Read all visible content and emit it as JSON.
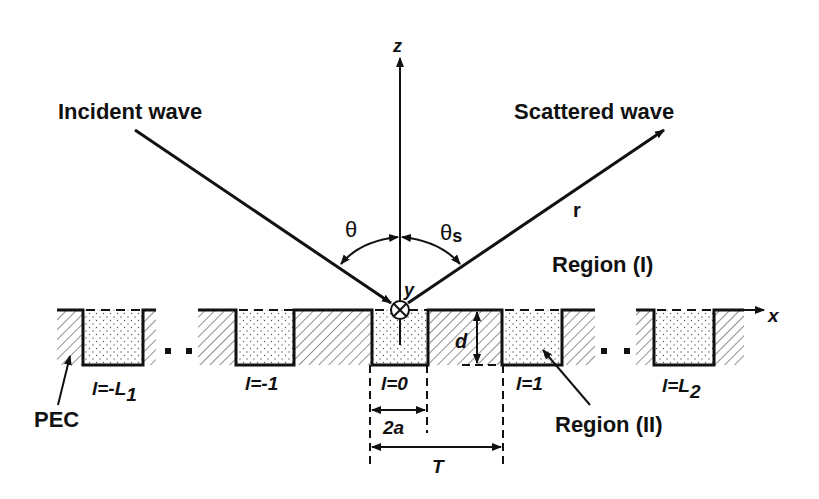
{
  "labels": {
    "incident_wave": "Incident wave",
    "scattered_wave": "Scattered wave",
    "z_axis": "z",
    "x_axis": "x",
    "y_axis": "y",
    "theta": "θ",
    "theta_s_main": "θ",
    "theta_s_sub": "s",
    "r": "r",
    "region_1": "Region (I)",
    "region_2": "Region (II)",
    "pec": "PEC",
    "d": "d",
    "two_a": "2a",
    "T": "T"
  },
  "grooves": [
    {
      "label_main": "l=-L",
      "label_sub": "1"
    },
    {
      "label_main": "l=-1",
      "label_sub": ""
    },
    {
      "label_main": "l=0",
      "label_sub": ""
    },
    {
      "label_main": "l=1",
      "label_sub": ""
    },
    {
      "label_main": "l=L",
      "label_sub": "2"
    }
  ],
  "colors": {
    "ink": "#111111",
    "background": "#ffffff"
  }
}
